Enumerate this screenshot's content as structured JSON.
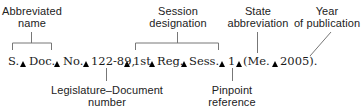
{
  "diagram": {
    "citation_parts": [
      {
        "text": "S.",
        "x": 8
      },
      {
        "text": "Doc.",
        "x": 29
      },
      {
        "text": "No.",
        "x": 64
      },
      {
        "text": "122-89,",
        "x": 92
      },
      {
        "text": "1st",
        "x": 134
      },
      {
        "text": "Reg.",
        "x": 158
      },
      {
        "text": "Sess.",
        "x": 190
      },
      {
        "text": "1",
        "x": 229
      },
      {
        "text": "(Me.",
        "x": 244
      },
      {
        "text": "2005).",
        "x": 281
      }
    ],
    "space_markers": [
      {
        "x": 23
      },
      {
        "x": 57
      },
      {
        "x": 86
      },
      {
        "x": 127
      },
      {
        "x": 152
      },
      {
        "x": 184
      },
      {
        "x": 222
      },
      {
        "x": 239
      },
      {
        "x": 275
      }
    ],
    "labels": {
      "abbreviated_name": {
        "line1": "Abbreviated",
        "line2": "name"
      },
      "session_designation": {
        "line1": "Session",
        "line2": "designation"
      },
      "state_abbreviation": {
        "line1": "State",
        "line2": "abbreviation"
      },
      "year_of_publication": {
        "line1": "Year",
        "line2": "of publication"
      },
      "legislature_document_number": {
        "line1": "Legislature–Document",
        "line2": "number"
      },
      "pinpoint_reference": {
        "line1": "Pinpoint",
        "line2": "reference"
      }
    },
    "colors": {
      "line": "#777777",
      "text": "#222222",
      "marker": "#000000"
    }
  }
}
